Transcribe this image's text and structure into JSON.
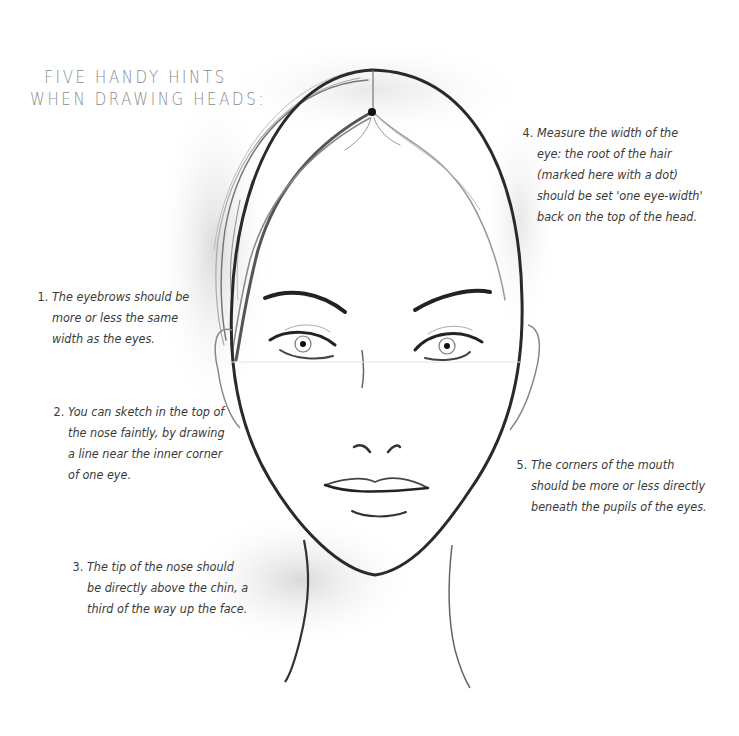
{
  "title": {
    "line1": "FIVE HANDY HINTS",
    "line2": "WHEN DRAWING HEADS:"
  },
  "hints": [
    {
      "number": "1.",
      "lines": [
        "The eyebrows should be",
        "more or less the same",
        "width as the eyes."
      ]
    },
    {
      "number": "2.",
      "lines": [
        "You can sketch in the top of",
        "the nose faintly, by drawing",
        "a line near the inner corner",
        "of one eye."
      ]
    },
    {
      "number": "3.",
      "lines": [
        "The tip of the nose should",
        "be directly above the chin, a",
        "third of the way up the face."
      ]
    },
    {
      "number": "4.",
      "lines": [
        "Measure the width of the",
        "eye: the root of the hair",
        "(marked here with a dot)",
        "should be set 'one eye-width'",
        "back on the top of the head."
      ]
    },
    {
      "number": "5.",
      "lines": [
        "The corners of the mouth",
        "should be more or less directly",
        "beneath the pupils of the eyes."
      ]
    }
  ],
  "illustration": {
    "subject": "female-head-sketch",
    "colors": {
      "stroke": "#2a2a2a",
      "shadow": "#d9d9d9",
      "text": "#3a3a3a",
      "title": "#8a8a8a"
    }
  }
}
